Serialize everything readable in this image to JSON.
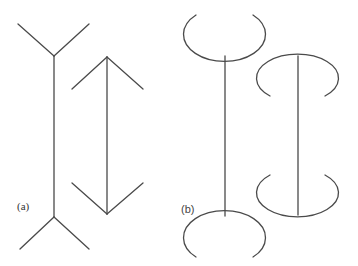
{
  "figure": {
    "panels": [
      {
        "id": "a",
        "label": "(a)",
        "description": "Müller-Lyer illusion: line with outward fins vs line with inward arrowheads",
        "figures": [
          "line-with-outward-fins",
          "line-with-arrowheads"
        ]
      },
      {
        "id": "b",
        "label": "(b)",
        "description": "Lines capped with elliptical arcs opening outward vs inward",
        "figures": [
          "line-with-outward-arcs",
          "line-with-inward-arcs"
        ]
      }
    ],
    "stroke_color": "#4a4a4a",
    "background": "#ffffff"
  }
}
